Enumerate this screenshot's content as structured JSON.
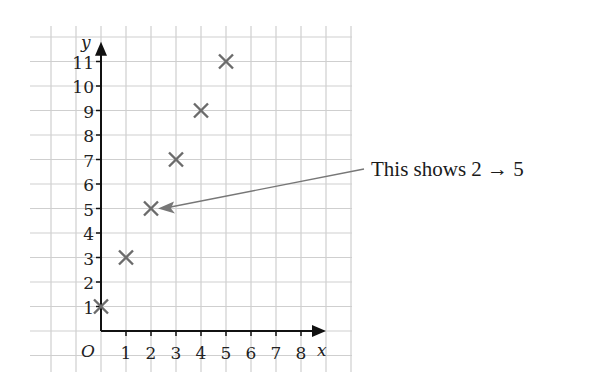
{
  "chart_data": {
    "type": "scatter",
    "title": "",
    "xlabel": "x",
    "ylabel": "y",
    "origin_label": "O",
    "x_ticks": [
      "1",
      "2",
      "3",
      "4",
      "5",
      "6",
      "7",
      "8"
    ],
    "y_ticks": [
      "1",
      "2",
      "3",
      "4",
      "5",
      "6",
      "7",
      "8",
      "9",
      "10",
      "11"
    ],
    "xlim": [
      0,
      8
    ],
    "ylim": [
      0,
      11
    ],
    "grid": true,
    "marker": "x",
    "points": [
      {
        "x": 0,
        "y": 1
      },
      {
        "x": 1,
        "y": 3
      },
      {
        "x": 2,
        "y": 5
      },
      {
        "x": 3,
        "y": 7
      },
      {
        "x": 4,
        "y": 9
      },
      {
        "x": 5,
        "y": 11
      }
    ],
    "annotations": [
      {
        "text": "This shows 2 → 5",
        "points_to": {
          "x": 2,
          "y": 5
        }
      }
    ]
  },
  "annotation": {
    "text": "This shows 2 → 5"
  },
  "colors": {
    "grid": "#cfcfcf",
    "axis": "#111111",
    "marker": "#6b6b6b",
    "arrow": "#777777"
  }
}
